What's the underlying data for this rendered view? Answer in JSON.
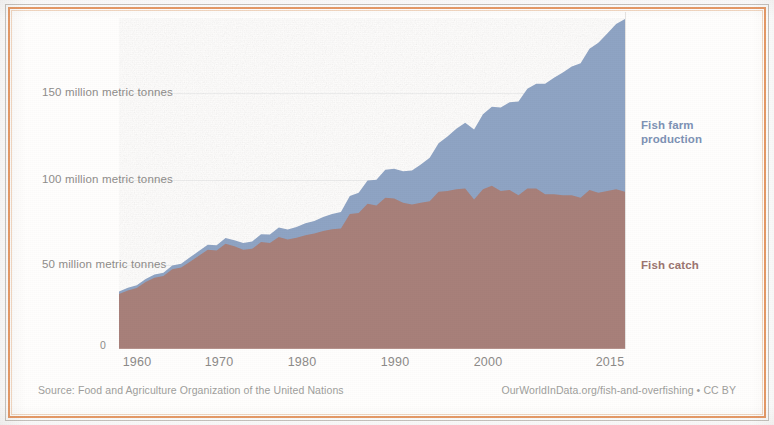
{
  "figure": {
    "background_color": "#ffffff",
    "frame_color": "#e79a66"
  },
  "axes": {
    "y_ticks": [
      {
        "value": 0,
        "label": "0"
      },
      {
        "value": 50,
        "label": "50 million metric tonnes"
      },
      {
        "value": 100,
        "label": "100 million metric tonnes"
      },
      {
        "value": 150,
        "label": "150 million metric tonnes"
      }
    ],
    "x_ticks": [
      {
        "value": 1960,
        "label": "1960"
      },
      {
        "value": 1970,
        "label": "1970"
      },
      {
        "value": 1980,
        "label": "1980"
      },
      {
        "value": 1990,
        "label": "1990"
      },
      {
        "value": 2000,
        "label": "2000"
      },
      {
        "value": 2015,
        "label": "2015"
      }
    ]
  },
  "series_labels": {
    "farm": "Fish farm\nproduction",
    "catch": "Fish catch"
  },
  "footer": {
    "source": "Source: Food and Agriculture Organization of the United Nations",
    "attribution": "OurWorldInData.org/fish-and-overfishing • CC BY"
  },
  "chart_data": {
    "type": "area",
    "stacked": true,
    "title": "",
    "subtitle": "",
    "xlabel": "",
    "ylabel": "million metric tonnes",
    "xlim": [
      1958,
      2015
    ],
    "ylim": [
      0,
      175
    ],
    "grid": false,
    "legend_position": "direct-labels-right",
    "x": [
      1958,
      1959,
      1960,
      1961,
      1962,
      1963,
      1964,
      1965,
      1966,
      1967,
      1968,
      1969,
      1970,
      1971,
      1972,
      1973,
      1974,
      1975,
      1976,
      1977,
      1978,
      1979,
      1980,
      1981,
      1982,
      1983,
      1984,
      1985,
      1986,
      1987,
      1988,
      1989,
      1990,
      1991,
      1992,
      1993,
      1994,
      1995,
      1996,
      1997,
      1998,
      1999,
      2000,
      2001,
      2002,
      2003,
      2004,
      2005,
      2006,
      2007,
      2008,
      2009,
      2010,
      2011,
      2012,
      2013,
      2014,
      2015
    ],
    "series": [
      {
        "name": "Fish catch",
        "color": "#a8807a",
        "values": [
          32.0,
          34.0,
          35.5,
          39.0,
          41.5,
          42.5,
          46.5,
          47.5,
          51.0,
          54.5,
          58.0,
          57.5,
          61.5,
          60.0,
          58.0,
          58.5,
          62.5,
          62.0,
          65.5,
          64.0,
          65.0,
          66.5,
          67.5,
          69.0,
          70.0,
          70.5,
          79.0,
          79.5,
          85.0,
          84.0,
          88.5,
          88.0,
          85.5,
          84.5,
          85.5,
          86.5,
          92.0,
          92.5,
          93.5,
          94.0,
          87.5,
          93.5,
          95.5,
          92.5,
          93.0,
          90.0,
          94.0,
          94.0,
          90.5,
          90.5,
          90.0,
          90.0,
          88.5,
          93.0,
          91.5,
          92.5,
          93.5,
          92.0
        ]
      },
      {
        "name": "Fish farm production",
        "color": "#8fa4c4",
        "values": [
          1.5,
          1.6,
          1.7,
          1.8,
          1.9,
          2.0,
          2.2,
          2.3,
          2.5,
          2.7,
          2.9,
          3.1,
          3.4,
          3.6,
          4.0,
          4.3,
          4.6,
          5.0,
          5.5,
          5.9,
          6.4,
          7.0,
          7.4,
          8.2,
          8.9,
          9.7,
          10.6,
          11.9,
          13.6,
          15.0,
          16.5,
          17.5,
          18.5,
          20.0,
          22.5,
          25.5,
          28.5,
          32.0,
          35.5,
          38.5,
          41.0,
          44.0,
          46.5,
          49.0,
          51.5,
          55.0,
          58.5,
          61.5,
          65.0,
          68.5,
          72.0,
          75.5,
          79.0,
          83.0,
          88.0,
          92.5,
          97.0,
          101.5
        ]
      }
    ],
    "totals_note": {
      "1958": 33.5,
      "2015": 193.5
    }
  }
}
